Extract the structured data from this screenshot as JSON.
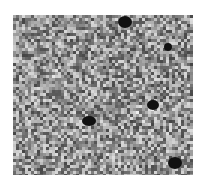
{
  "image": {
    "description": "grayscale micrograph with granular speckled texture",
    "background": "#ffffff",
    "base_tone": "#8a8a8a",
    "dark_spots": [
      {
        "x": 112,
        "y": 7,
        "rx": 7,
        "ry": 6
      },
      {
        "x": 155,
        "y": 32,
        "rx": 4,
        "ry": 4
      },
      {
        "x": 140,
        "y": 90,
        "rx": 6,
        "ry": 5
      },
      {
        "x": 76,
        "y": 106,
        "rx": 7,
        "ry": 5
      },
      {
        "x": 162,
        "y": 148,
        "rx": 7,
        "ry": 6
      }
    ],
    "light_patches": [
      {
        "x": 130,
        "y": 95,
        "r": 14
      },
      {
        "x": 40,
        "y": 60,
        "r": 12
      },
      {
        "x": 100,
        "y": 140,
        "r": 10
      }
    ]
  }
}
